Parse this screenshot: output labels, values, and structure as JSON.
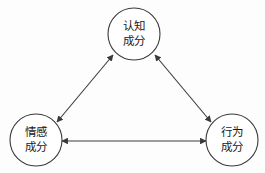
{
  "diagram": {
    "type": "triangle-relationship-diagram",
    "background_color": "#fdfdfd",
    "stroke_color": "#3a3a3a",
    "text_color": "#1a1a1a",
    "nodes": [
      {
        "id": "cognitive",
        "line1": "认知",
        "line2": "成分",
        "full_text": "认知成分",
        "cx": 134,
        "cy": 34,
        "r": 26
      },
      {
        "id": "affective",
        "line1": "情感",
        "line2": "成分",
        "full_text": "情感成分",
        "cx": 36,
        "cy": 140,
        "r": 26
      },
      {
        "id": "behavioral",
        "line1": "行为",
        "line2": "成分",
        "full_text": "行为成分",
        "cx": 232,
        "cy": 140,
        "r": 26
      }
    ],
    "edges": [
      {
        "id": "affective-cognitive",
        "from": "affective",
        "to": "cognitive",
        "direction": "bidirectional",
        "arrowheads": "both"
      },
      {
        "id": "cognitive-behavioral",
        "from": "cognitive",
        "to": "behavioral",
        "direction": "bidirectional",
        "arrowheads": "both"
      },
      {
        "id": "affective-behavioral",
        "from": "behavioral",
        "to": "affective",
        "direction": "bidirectional",
        "arrowheads": "both"
      }
    ]
  }
}
